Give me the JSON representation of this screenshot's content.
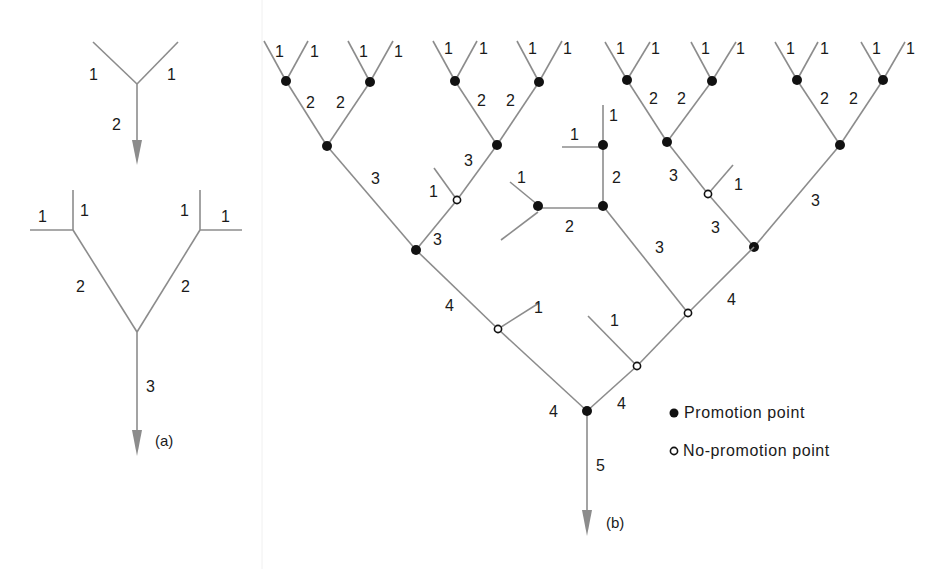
{
  "figure": {
    "top_cutoff_text": "",
    "panel_a": {
      "caption": "(a)",
      "tree1": {
        "leaf_labels": [
          "1",
          "1"
        ],
        "stem_label": "2"
      },
      "tree2": {
        "leaf_labels": [
          "1",
          "1",
          "1",
          "1"
        ],
        "branch_labels": [
          "2",
          "2"
        ],
        "stem_label": "3"
      }
    },
    "panel_b": {
      "caption": "(b)",
      "root_stem_label": "5",
      "labels": {
        "top_leaves": [
          "1",
          "1",
          "1",
          "1",
          "1",
          "1",
          "1",
          "1",
          "1",
          "1",
          "1",
          "1",
          "1",
          "1",
          "1",
          "1"
        ],
        "g1": [
          "2",
          "2"
        ],
        "g2": [
          "2",
          "2"
        ],
        "g3": [
          "2",
          "2"
        ],
        "g4": [
          "2",
          "2"
        ],
        "g1_down": "3",
        "g2_down": "3",
        "g2_side": "1",
        "g2_lower": "3",
        "mid_top_leaf": "1",
        "mid_left_leaf": "1",
        "mid_vertical": "2",
        "mid_horizontal": "2",
        "mid_left_side": "1",
        "mid_down": "3",
        "g3_down": "3",
        "g3_side": "1",
        "g3_lower": "3",
        "g4_down": "3",
        "left_4": "4",
        "left_side_1": "1",
        "right_4": "4",
        "right_side_1": "1",
        "root_left_4": "4",
        "root_right_4": "4"
      },
      "legend": {
        "promotion": "Promotion point",
        "no_promotion": "No-promotion point"
      }
    },
    "colors": {
      "edge": "#8c8c8c",
      "node": "#111111",
      "text": "#1a1a1a",
      "background": "#ffffff"
    }
  }
}
